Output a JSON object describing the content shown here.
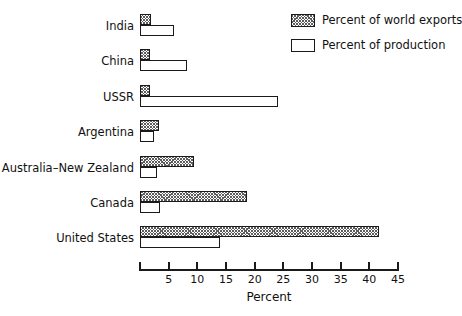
{
  "chart_data": {
    "type": "bar",
    "orientation": "horizontal",
    "title": "",
    "xlabel": "Percent",
    "ylabel": "",
    "xlim": [
      0,
      45
    ],
    "xticks": [
      0,
      5,
      10,
      15,
      20,
      25,
      30,
      35,
      40,
      45
    ],
    "xtick_labels": [
      "",
      "5",
      "10",
      "15",
      "20",
      "25",
      "30",
      "35",
      "40",
      "45"
    ],
    "grid": false,
    "legend_position": "top-right",
    "categories": [
      "India",
      "China",
      "USSR",
      "Argentina",
      "Australia–New Zealand",
      "Canada",
      "United States"
    ],
    "series": [
      {
        "name": "Percent of world exports",
        "fill": "hatched",
        "values": [
          2.0,
          1.8,
          1.8,
          3.4,
          9.4,
          18.7,
          41.6
        ]
      },
      {
        "name": "Percent of production",
        "fill": "white",
        "values": [
          6.0,
          8.2,
          24.0,
          2.4,
          3.0,
          3.5,
          14.0
        ]
      }
    ]
  },
  "legend": {
    "items": [
      {
        "label": "Percent of world exports",
        "swatch": "hatched"
      },
      {
        "label": "Percent of production",
        "swatch": "white"
      }
    ]
  },
  "axis": {
    "title": "Percent"
  },
  "colors": {
    "line": "#1a1a1a",
    "hatch": "#5d5d5d",
    "background": "#ffffff",
    "text": "#111111"
  }
}
